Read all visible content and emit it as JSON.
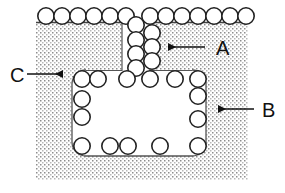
{
  "figure": {
    "background_color": "#ffffff",
    "substrate": {
      "name": "hatched-substrate",
      "fill_pattern": "fine-dot-stipple",
      "pattern_dot_color": "#8a8a8a",
      "outline_color": "#555555",
      "bounds": {
        "x": 36,
        "y": 22,
        "width": 212,
        "height": 158
      }
    },
    "cavity": {
      "name": "rounded-cavity",
      "fill_color": "#ffffff",
      "outline_color": "#555555",
      "corner_radius": 14,
      "bounds": {
        "x": 72,
        "y": 70,
        "width": 134,
        "height": 86
      }
    },
    "channel": {
      "name": "vertical-channel",
      "fill_color": "#ffffff",
      "bounds": {
        "x": 122,
        "y": 22,
        "width": 28,
        "height": 48
      }
    },
    "circle_style": {
      "fill_color": "#ffffff",
      "stroke_color": "#222222",
      "stroke_width": 1.6,
      "radius": 8.2
    },
    "circles": {
      "top_row_left": [
        {
          "cx": 46,
          "cy": 16
        },
        {
          "cx": 62,
          "cy": 16
        },
        {
          "cx": 78,
          "cy": 16
        },
        {
          "cx": 94,
          "cy": 16
        },
        {
          "cx": 110,
          "cy": 16
        },
        {
          "cx": 126,
          "cy": 16
        }
      ],
      "top_row_right": [
        {
          "cx": 150,
          "cy": 16
        },
        {
          "cx": 166,
          "cy": 16
        },
        {
          "cx": 182,
          "cy": 16
        },
        {
          "cx": 198,
          "cy": 16
        },
        {
          "cx": 214,
          "cy": 16
        },
        {
          "cx": 230,
          "cy": 16
        },
        {
          "cx": 246,
          "cy": 16
        }
      ],
      "channel_left_column": [
        {
          "cx": 136,
          "cy": 24
        },
        {
          "cx": 136,
          "cy": 39
        },
        {
          "cx": 136,
          "cy": 53
        },
        {
          "cx": 136,
          "cy": 67
        },
        {
          "cx": 127,
          "cy": 78
        }
      ],
      "channel_right_column": [
        {
          "cx": 152,
          "cy": 33
        },
        {
          "cx": 152,
          "cy": 47
        },
        {
          "cx": 152,
          "cy": 61
        },
        {
          "cx": 150,
          "cy": 78
        }
      ],
      "cavity_top_edge": [
        {
          "cx": 82,
          "cy": 78
        },
        {
          "cx": 98,
          "cy": 78
        },
        {
          "cx": 126,
          "cy": 78
        },
        {
          "cx": 175,
          "cy": 78
        }
      ],
      "cavity_left_edge": [
        {
          "cx": 82,
          "cy": 98
        },
        {
          "cx": 82,
          "cy": 116
        },
        {
          "cx": 82,
          "cy": 146
        }
      ],
      "cavity_right_edge": [
        {
          "cx": 198,
          "cy": 78
        },
        {
          "cx": 198,
          "cy": 95
        },
        {
          "cx": 198,
          "cy": 118
        },
        {
          "cx": 198,
          "cy": 146
        }
      ],
      "cavity_bottom_edge": [
        {
          "cx": 110,
          "cy": 146
        },
        {
          "cx": 128,
          "cy": 146
        },
        {
          "cx": 160,
          "cy": 146
        }
      ]
    },
    "annotations": [
      {
        "id": "A",
        "name": "callout-a",
        "label": "A",
        "label_x": 216,
        "label_y": 55,
        "arrow_tail_x": 205,
        "arrow_tail_y": 47,
        "arrow_head_x": 161,
        "arrow_head_y": 47,
        "direction": "left",
        "points_to": "right-hatched-block"
      },
      {
        "id": "B",
        "name": "callout-b",
        "label": "B",
        "label_x": 262,
        "label_y": 116,
        "arrow_tail_x": 254,
        "arrow_tail_y": 109,
        "arrow_head_x": 211,
        "arrow_head_y": 109,
        "direction": "left",
        "points_to": "cavity-right-wall"
      },
      {
        "id": "C",
        "name": "callout-c",
        "label": "C",
        "label_x": 14,
        "label_y": 81,
        "arrow_tail_x": 27,
        "arrow_tail_y": 74,
        "arrow_head_x": 70,
        "arrow_head_y": 74,
        "direction": "right",
        "points_to": "cavity-left-wall"
      }
    ]
  }
}
